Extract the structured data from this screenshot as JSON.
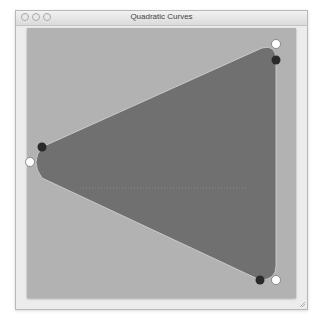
{
  "window": {
    "title": "Quadratic Curves",
    "buttons": [
      "close",
      "minimize",
      "zoom"
    ]
  },
  "canvas": {
    "background_color": "#b2b2b2",
    "shape_fill_color": "#707070",
    "shape_stroke_color": "#d0d0d0",
    "on_curve_points": [
      {
        "x": 276,
        "y": 60
      },
      {
        "x": 42,
        "y": 147
      },
      {
        "x": 260,
        "y": 280
      }
    ],
    "control_points": [
      {
        "x": 276,
        "y": 44
      },
      {
        "x": 30,
        "y": 162
      },
      {
        "x": 276,
        "y": 280
      }
    ]
  }
}
